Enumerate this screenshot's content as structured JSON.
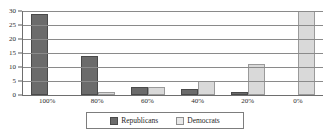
{
  "chart_data": {
    "type": "bar",
    "title": "",
    "xlabel": "",
    "ylabel": "",
    "categories": [
      "100%",
      "80%",
      "60%",
      "40%",
      "20%",
      "0%"
    ],
    "series": [
      {
        "name": "Republicans",
        "values": [
          29,
          14,
          3,
          2,
          1,
          0
        ],
        "color": "#6b6b6b"
      },
      {
        "name": "Democrats",
        "values": [
          0,
          1,
          3,
          5,
          11,
          30
        ],
        "color": "#d9d9d9"
      }
    ],
    "ylim": [
      0,
      30
    ],
    "yticks": [
      0,
      5,
      10,
      15,
      20,
      25,
      30
    ],
    "ytick_labels": [
      "0",
      "5",
      "10",
      "15",
      "20",
      "25",
      "30"
    ],
    "grid": true,
    "legend_position": "bottom"
  },
  "legend": {
    "entries": [
      {
        "label": "Republicans",
        "swatch": "dark-gray-swatch"
      },
      {
        "label": "Democrats",
        "swatch": "light-gray-swatch"
      }
    ]
  }
}
